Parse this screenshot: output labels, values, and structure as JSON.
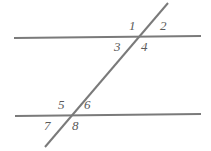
{
  "figure": {
    "width": 211,
    "height": 151,
    "background_color": "#ffffff",
    "line_color": "#7a7a7a",
    "label_color": "#5a5a5a"
  },
  "lines": [
    {
      "name": "top-parallel-line",
      "x1": 14,
      "y1": 38,
      "x2": 201,
      "y2": 36,
      "stroke_width": 2
    },
    {
      "name": "bottom-parallel-line",
      "x1": 15,
      "y1": 116,
      "x2": 201,
      "y2": 114,
      "stroke_width": 2
    },
    {
      "name": "transversal-line",
      "x1": 168,
      "y1": 3,
      "x2": 45,
      "y2": 147,
      "stroke_width": 2
    }
  ],
  "intersections": [
    {
      "name": "upper-intersection",
      "x": 137,
      "y": 37
    },
    {
      "name": "lower-intersection",
      "x": 69,
      "y": 116
    }
  ],
  "labels": [
    {
      "id": "1",
      "text": "1",
      "x": 129,
      "y": 19
    },
    {
      "id": "2",
      "text": "2",
      "x": 160,
      "y": 19
    },
    {
      "id": "3",
      "text": "3",
      "x": 114,
      "y": 40
    },
    {
      "id": "4",
      "text": "4",
      "x": 141,
      "y": 40
    },
    {
      "id": "5",
      "text": "5",
      "x": 58,
      "y": 98
    },
    {
      "id": "6",
      "text": "6",
      "x": 84,
      "y": 98
    },
    {
      "id": "7",
      "text": "7",
      "x": 44,
      "y": 119
    },
    {
      "id": "8",
      "text": "8",
      "x": 72,
      "y": 119
    }
  ]
}
